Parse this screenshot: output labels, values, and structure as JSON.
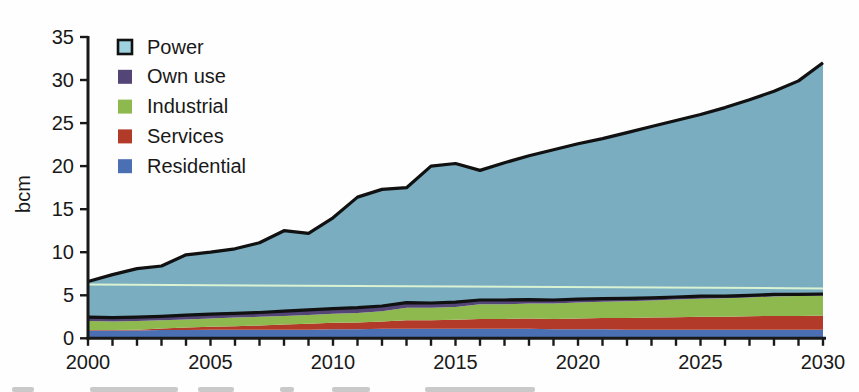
{
  "figure": {
    "background": "#fefefe",
    "axis_color": "#191919",
    "text_color": "#191919",
    "outline_color": "#111111",
    "tick_font_size": 20,
    "legend_font_size": 20
  },
  "chart_data": {
    "type": "area",
    "stacked": true,
    "title": "",
    "xlabel": "",
    "ylabel": "bcm",
    "ylim": [
      0,
      35
    ],
    "xlim": [
      2000,
      2030
    ],
    "grid": false,
    "y_ticks": [
      0,
      5,
      10,
      15,
      20,
      25,
      30,
      35
    ],
    "x_tick_labels": [
      2000,
      2005,
      2010,
      2015,
      2020,
      2025,
      2030
    ],
    "x_minor_tick_every_year": true,
    "x": [
      2000,
      2001,
      2002,
      2003,
      2004,
      2005,
      2006,
      2007,
      2008,
      2009,
      2010,
      2011,
      2012,
      2013,
      2014,
      2015,
      2016,
      2017,
      2018,
      2019,
      2020,
      2021,
      2022,
      2023,
      2024,
      2025,
      2026,
      2027,
      2028,
      2029,
      2030
    ],
    "series": [
      {
        "name": "Residential",
        "color": "#4a6fb2",
        "values": [
          0.9,
          0.9,
          0.9,
          0.95,
          0.95,
          1.0,
          1.0,
          1.0,
          1.0,
          1.0,
          1.05,
          1.05,
          1.1,
          1.1,
          1.1,
          1.1,
          1.1,
          1.1,
          1.1,
          1.05,
          1.05,
          1.05,
          1.0,
          1.0,
          1.0,
          1.0,
          1.0,
          1.0,
          1.0,
          1.0,
          1.0
        ]
      },
      {
        "name": "Services",
        "color": "#b23a28",
        "values": [
          0.05,
          0.05,
          0.1,
          0.2,
          0.3,
          0.35,
          0.4,
          0.5,
          0.6,
          0.7,
          0.75,
          0.8,
          0.85,
          1.0,
          1.0,
          1.05,
          1.15,
          1.15,
          1.2,
          1.2,
          1.25,
          1.3,
          1.35,
          1.4,
          1.45,
          1.5,
          1.5,
          1.55,
          1.6,
          1.6,
          1.65
        ]
      },
      {
        "name": "Industrial",
        "color": "#8db94e",
        "values": [
          1.05,
          1.0,
          1.0,
          0.95,
          0.95,
          0.95,
          1.0,
          1.0,
          1.0,
          1.0,
          1.05,
          1.1,
          1.2,
          1.45,
          1.45,
          1.5,
          1.7,
          1.7,
          1.75,
          1.8,
          1.85,
          1.9,
          1.95,
          2.0,
          2.05,
          2.1,
          2.15,
          2.2,
          2.25,
          2.3,
          2.3
        ]
      },
      {
        "name": "Own use",
        "color": "#544577",
        "values": [
          0.45,
          0.45,
          0.45,
          0.45,
          0.5,
          0.5,
          0.5,
          0.5,
          0.55,
          0.6,
          0.6,
          0.6,
          0.6,
          0.6,
          0.55,
          0.55,
          0.5,
          0.5,
          0.45,
          0.4,
          0.4,
          0.35,
          0.35,
          0.3,
          0.3,
          0.3,
          0.25,
          0.25,
          0.25,
          0.2,
          0.2
        ]
      },
      {
        "name": "Power",
        "color": "#7badc0",
        "outlined": true,
        "values": [
          4.15,
          5.0,
          5.65,
          5.85,
          7.0,
          7.2,
          7.5,
          8.1,
          9.35,
          8.9,
          10.55,
          12.85,
          13.55,
          13.35,
          15.9,
          16.1,
          15.05,
          15.95,
          16.7,
          17.45,
          18.05,
          18.6,
          19.25,
          19.9,
          20.5,
          21.1,
          21.9,
          22.7,
          23.6,
          24.8,
          26.85
        ]
      }
    ],
    "total": [
      6.6,
      7.4,
      8.1,
      8.4,
      9.7,
      10.0,
      10.4,
      11.1,
      12.5,
      12.2,
      14.0,
      16.4,
      17.3,
      17.5,
      20.0,
      20.3,
      19.5,
      20.4,
      21.2,
      21.9,
      22.6,
      23.2,
      23.9,
      24.6,
      25.3,
      26.0,
      26.8,
      27.7,
      28.7,
      29.9,
      32.0
    ],
    "reference_line": {
      "color": "#d8f2d2",
      "points": [
        [
          2000,
          6.25
        ],
        [
          2030,
          5.8
        ]
      ]
    },
    "legend": {
      "position": "top-left",
      "order": [
        "Power",
        "Own use",
        "Industrial",
        "Services",
        "Residential"
      ],
      "power_swatch_fill": "#9ed2df"
    }
  },
  "caption_remnant_marks": [
    {
      "x": 12,
      "w": 22
    },
    {
      "x": 90,
      "w": 88
    },
    {
      "x": 198,
      "w": 36
    },
    {
      "x": 280,
      "w": 14
    },
    {
      "x": 332,
      "w": 38
    },
    {
      "x": 425,
      "w": 110
    }
  ]
}
